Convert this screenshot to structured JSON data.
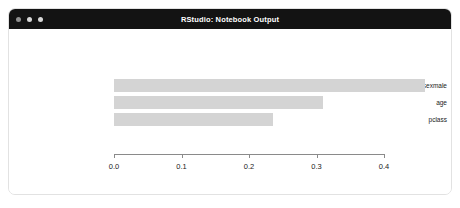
{
  "window": {
    "title": "RStudio: Notebook Output",
    "traffic_lights": [
      {
        "name": "close",
        "color": "#8f8f8f"
      },
      {
        "name": "minimize",
        "color": "#d8d8d8"
      },
      {
        "name": "zoom",
        "color": "#d8d8d8"
      }
    ],
    "titlebar_color": "#131313",
    "background_color": "#ffffff",
    "border_color": "#e2e2e2"
  },
  "chart_data": {
    "type": "bar",
    "orientation": "horizontal",
    "title": "",
    "subtitle": "",
    "xlabel": "",
    "ylabel": "",
    "categories": [
      "sexmale",
      "age",
      "pclass"
    ],
    "values": [
      0.46,
      0.31,
      0.235
    ],
    "series": [
      {
        "name": "importance",
        "values": [
          0.46,
          0.31,
          0.235
        ]
      }
    ],
    "xlim": [
      0.0,
      0.4
    ],
    "xticks": [
      0.0,
      0.1,
      0.2,
      0.3,
      0.4
    ],
    "xtick_labels": [
      "0.0",
      "0.1",
      "0.2",
      "0.3",
      "0.4"
    ],
    "grid": false,
    "legend": false,
    "legend_position": "none",
    "bar_color": "#d4d4d4",
    "axis_color": "#8a8a8a",
    "plot_background": "#ffffff"
  }
}
